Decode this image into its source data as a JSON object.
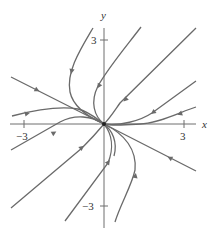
{
  "diagram": {
    "type": "phase-portrait",
    "axes": {
      "x_label": "x",
      "y_label": "y",
      "x_ticks": [
        {
          "value": -3,
          "label": "−3"
        },
        {
          "value": 3,
          "label": "3"
        }
      ],
      "y_ticks": [
        {
          "value": 3,
          "label": "3"
        },
        {
          "value": -3,
          "label": "−3"
        }
      ]
    },
    "critical_point": {
      "x": 0,
      "y": 0,
      "type": "stable node"
    },
    "colors": {
      "trajectory": "#6a6a6a",
      "axis": "#6e6e6e",
      "background": "#ffffff"
    },
    "trajectories_count": 12
  }
}
